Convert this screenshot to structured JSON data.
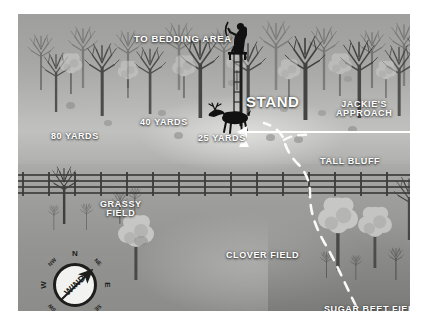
{
  "map": {
    "title": "Deer hunting stand strategy map",
    "labels": [
      {
        "key": "bedding",
        "text": "TO BEDDING AREA",
        "x": 116,
        "y": 20,
        "size": 9.5
      },
      {
        "key": "stand",
        "text": "STAND",
        "x": 228,
        "y": 80,
        "size": 15
      },
      {
        "key": "jackies_approach",
        "text": "JACKIE'S\nAPPROACH",
        "x": 318,
        "y": 86,
        "size": 9,
        "align": "center"
      },
      {
        "key": "yards_80",
        "text": "80 YARDS",
        "x": 33,
        "y": 118,
        "size": 9
      },
      {
        "key": "yards_40",
        "text": "40 YARDS",
        "x": 122,
        "y": 104,
        "size": 9
      },
      {
        "key": "yards_25",
        "text": "25 YARDS",
        "x": 180,
        "y": 120,
        "size": 9
      },
      {
        "key": "tall_bluff",
        "text": "TALL BLUFF",
        "x": 302,
        "y": 143,
        "size": 9
      },
      {
        "key": "grassy_field",
        "text": "GRASSY\nFIELD",
        "x": 82,
        "y": 186,
        "size": 9,
        "align": "center"
      },
      {
        "key": "clover_field",
        "text": "CLOVER FIELD",
        "x": 208,
        "y": 237,
        "size": 9
      },
      {
        "key": "sugar_beet_field",
        "text": "SUGAR BEET FIELD",
        "x": 306,
        "y": 291,
        "size": 9
      }
    ],
    "compass": {
      "center_label": "WIND",
      "cardinals": [
        "N",
        "NE",
        "E",
        "SE",
        "S",
        "SW",
        "W",
        "NW"
      ],
      "arrow_direction": "NE"
    },
    "figures": [
      {
        "key": "hunter-in-treestand",
        "label": "hunter in treestand"
      },
      {
        "key": "buck-deer",
        "label": "buck deer walking"
      }
    ],
    "features": [
      {
        "key": "rail-fence",
        "label": "rail fence"
      },
      {
        "key": "deer-trail",
        "label": "dashed deer trail"
      },
      {
        "key": "approach-arrow",
        "label": "white approach arrow"
      }
    ],
    "colors": {
      "label_text": "#ffffff",
      "line_white": "#ffffff",
      "silhouette": "#141414",
      "ground_light": "#b9b9b7",
      "ground_dark": "#8c8c8a",
      "compass_face": "#f2f2f0",
      "compass_ring": "#1d1d1b"
    }
  }
}
